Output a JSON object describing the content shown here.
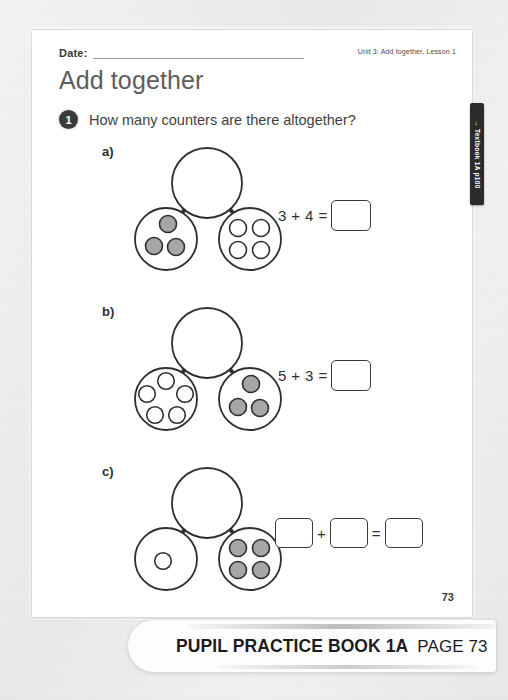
{
  "worksheet": {
    "date_label": "Date:",
    "unit_label": "Unit 3: Add together, Lesson 1",
    "title": "Add together",
    "question_number": "1",
    "question_text": "How many counters are there altogether?",
    "textbook_tab": "→ Textbook 1A p100",
    "page_number": "73"
  },
  "problems": [
    {
      "letter": "a)",
      "whole_counters": 0,
      "left_part": {
        "count": 3,
        "fill": "grey"
      },
      "right_part": {
        "count": 4,
        "fill": "white"
      },
      "equation": {
        "left": "3",
        "plus": "+",
        "right": "4",
        "equals": "=",
        "answer": "",
        "left_is_box": false,
        "right_is_box": false
      }
    },
    {
      "letter": "b)",
      "whole_counters": 0,
      "left_part": {
        "count": 5,
        "fill": "white"
      },
      "right_part": {
        "count": 3,
        "fill": "grey"
      },
      "equation": {
        "left": "5",
        "plus": "+",
        "right": "3",
        "equals": "=",
        "answer": "",
        "left_is_box": false,
        "right_is_box": false
      }
    },
    {
      "letter": "c)",
      "whole_counters": 0,
      "left_part": {
        "count": 1,
        "fill": "white"
      },
      "right_part": {
        "count": 4,
        "fill": "grey"
      },
      "equation": {
        "left": "",
        "plus": "+",
        "right": "",
        "equals": "=",
        "answer": "",
        "left_is_box": true,
        "right_is_box": true
      }
    }
  ],
  "footer": {
    "book_title": "PUPIL PRACTICE BOOK 1A",
    "page_label": "PAGE 73"
  },
  "colors": {
    "counter_grey": "#a6a6a6",
    "counter_white": "#ffffff",
    "outline": "#2f2f2f",
    "title_grey": "#5d5d5d",
    "badge_dark": "#3c3c3c",
    "tab_black": "#2b2b2b"
  }
}
